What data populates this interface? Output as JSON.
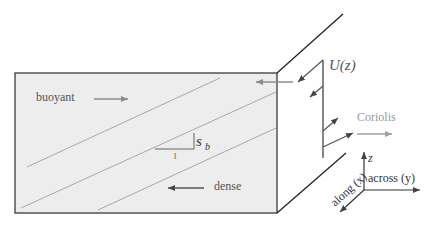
{
  "diagram": {
    "labels": {
      "buoyant": "buoyant",
      "dense": "dense",
      "slope_symbol": "s",
      "slope_sub": "b",
      "slope_run": "1",
      "velocity_profile": "U(z)",
      "coriolis": "Coriolis",
      "axis_z": "z",
      "axis_across": "across (y)",
      "axis_along": "along (x)"
    },
    "colors": {
      "box_fill": "#ededed",
      "box_edge": "#333333",
      "isopycnal": "#a8a8a8",
      "arrow_gray": "#8c8c8c",
      "text_gray": "#555555",
      "coriolis_gray": "#9a9a9a",
      "axis": "#333333"
    }
  }
}
